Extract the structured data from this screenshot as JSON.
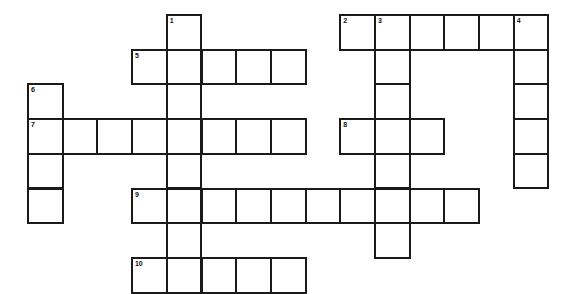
{
  "puzzle": {
    "title": "Crossword Puzzle Grid",
    "grid": {
      "cell_size": 34.7,
      "origin_x": 27,
      "origin_y": 14,
      "columns": 16,
      "rows": 8,
      "border_color": "#1a1a1a",
      "cell_fill": "#ffffff",
      "page_background": "#ffffff"
    },
    "numbers": [
      "1",
      "2",
      "3",
      "4",
      "5",
      "6",
      "7",
      "8",
      "9",
      "10"
    ],
    "entries": [
      {
        "number": "1",
        "direction": "down",
        "col": 4,
        "row": 0,
        "length": 5
      },
      {
        "number": "2",
        "direction": "across",
        "col": 9,
        "row": 0,
        "length": 6
      },
      {
        "number": "3",
        "direction": "down",
        "col": 10,
        "row": 0,
        "length": 7
      },
      {
        "number": "4",
        "direction": "down",
        "col": 14,
        "row": 0,
        "length": 5
      },
      {
        "number": "5",
        "direction": "across",
        "col": 3,
        "row": 1,
        "length": 5
      },
      {
        "number": "6",
        "direction": "down",
        "col": 0,
        "row": 2,
        "length": 4
      },
      {
        "number": "7",
        "direction": "across",
        "col": 0,
        "row": 3,
        "length": 8
      },
      {
        "number": "8",
        "direction": "across",
        "col": 9,
        "row": 3,
        "length": 3
      },
      {
        "number": "9",
        "direction": "across",
        "col": 3,
        "row": 5,
        "length": 10
      },
      {
        "number": "10",
        "direction": "across",
        "col": 3,
        "row": 7,
        "length": 5
      }
    ],
    "cells": [
      {
        "col": 4,
        "row": 0,
        "number": "1",
        "letter": ""
      },
      {
        "col": 9,
        "row": 0,
        "number": "2",
        "letter": ""
      },
      {
        "col": 10,
        "row": 0,
        "number": "3",
        "letter": ""
      },
      {
        "col": 11,
        "row": 0,
        "number": "",
        "letter": ""
      },
      {
        "col": 12,
        "row": 0,
        "number": "",
        "letter": ""
      },
      {
        "col": 13,
        "row": 0,
        "number": "",
        "letter": ""
      },
      {
        "col": 14,
        "row": 0,
        "number": "4",
        "letter": ""
      },
      {
        "col": 3,
        "row": 1,
        "number": "5",
        "letter": ""
      },
      {
        "col": 4,
        "row": 1,
        "number": "",
        "letter": ""
      },
      {
        "col": 5,
        "row": 1,
        "number": "",
        "letter": ""
      },
      {
        "col": 6,
        "row": 1,
        "number": "",
        "letter": ""
      },
      {
        "col": 7,
        "row": 1,
        "number": "",
        "letter": ""
      },
      {
        "col": 10,
        "row": 1,
        "number": "",
        "letter": ""
      },
      {
        "col": 14,
        "row": 1,
        "number": "",
        "letter": ""
      },
      {
        "col": 0,
        "row": 2,
        "number": "6",
        "letter": ""
      },
      {
        "col": 4,
        "row": 2,
        "number": "",
        "letter": ""
      },
      {
        "col": 10,
        "row": 2,
        "number": "",
        "letter": ""
      },
      {
        "col": 14,
        "row": 2,
        "number": "",
        "letter": ""
      },
      {
        "col": 0,
        "row": 3,
        "number": "7",
        "letter": ""
      },
      {
        "col": 1,
        "row": 3,
        "number": "",
        "letter": ""
      },
      {
        "col": 2,
        "row": 3,
        "number": "",
        "letter": ""
      },
      {
        "col": 3,
        "row": 3,
        "number": "",
        "letter": ""
      },
      {
        "col": 4,
        "row": 3,
        "number": "",
        "letter": ""
      },
      {
        "col": 5,
        "row": 3,
        "number": "",
        "letter": ""
      },
      {
        "col": 6,
        "row": 3,
        "number": "",
        "letter": ""
      },
      {
        "col": 7,
        "row": 3,
        "number": "",
        "letter": ""
      },
      {
        "col": 9,
        "row": 3,
        "number": "8",
        "letter": ""
      },
      {
        "col": 10,
        "row": 3,
        "number": "",
        "letter": ""
      },
      {
        "col": 11,
        "row": 3,
        "number": "",
        "letter": ""
      },
      {
        "col": 14,
        "row": 3,
        "number": "",
        "letter": ""
      },
      {
        "col": 0,
        "row": 4,
        "number": "",
        "letter": ""
      },
      {
        "col": 4,
        "row": 4,
        "number": "",
        "letter": ""
      },
      {
        "col": 10,
        "row": 4,
        "number": "",
        "letter": ""
      },
      {
        "col": 14,
        "row": 4,
        "number": "",
        "letter": ""
      },
      {
        "col": 0,
        "row": 5,
        "number": "",
        "letter": ""
      },
      {
        "col": 3,
        "row": 5,
        "number": "9",
        "letter": ""
      },
      {
        "col": 4,
        "row": 5,
        "number": "",
        "letter": ""
      },
      {
        "col": 5,
        "row": 5,
        "number": "",
        "letter": ""
      },
      {
        "col": 6,
        "row": 5,
        "number": "",
        "letter": ""
      },
      {
        "col": 7,
        "row": 5,
        "number": "",
        "letter": ""
      },
      {
        "col": 8,
        "row": 5,
        "number": "",
        "letter": ""
      },
      {
        "col": 9,
        "row": 5,
        "number": "",
        "letter": ""
      },
      {
        "col": 10,
        "row": 5,
        "number": "",
        "letter": ""
      },
      {
        "col": 11,
        "row": 5,
        "number": "",
        "letter": ""
      },
      {
        "col": 12,
        "row": 5,
        "number": "",
        "letter": ""
      },
      {
        "col": 4,
        "row": 6,
        "number": "",
        "letter": ""
      },
      {
        "col": 10,
        "row": 6,
        "number": "",
        "letter": ""
      },
      {
        "col": 3,
        "row": 7,
        "number": "10",
        "letter": ""
      },
      {
        "col": 4,
        "row": 7,
        "number": "",
        "letter": ""
      },
      {
        "col": 5,
        "row": 7,
        "number": "",
        "letter": ""
      },
      {
        "col": 6,
        "row": 7,
        "number": "",
        "letter": ""
      },
      {
        "col": 7,
        "row": 7,
        "number": "",
        "letter": ""
      }
    ]
  }
}
